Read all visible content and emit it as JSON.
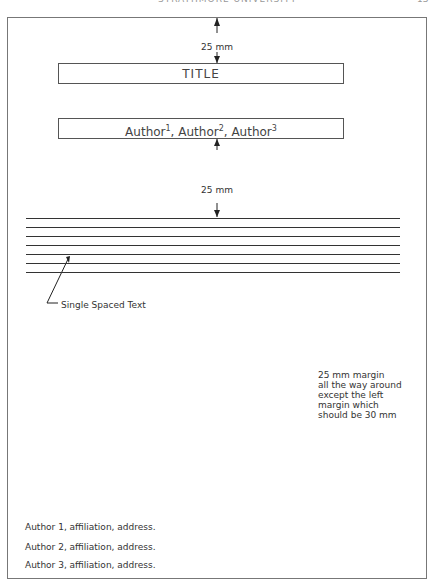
{
  "header": {
    "running_title": "STRATHMORE UNIVERSITY",
    "page_number": "13"
  },
  "template": {
    "top_margin_label": "25 mm",
    "title_box": "TITLE",
    "authors_box": {
      "names": [
        "Author",
        "Author",
        "Author"
      ],
      "superscripts": [
        "1",
        "2",
        "3"
      ],
      "separator": ", "
    },
    "gap_label": "25 mm",
    "text_lines_count": 7,
    "text_caption": "Single Spaced Text",
    "margin_note": [
      "25 mm margin",
      "all the way around",
      "except the left",
      "margin which",
      "should be 30 mm"
    ],
    "affiliations": [
      "Author 1, affiliation, address.",
      "Author 2, affiliation, address.",
      "Author 3, affiliation, address."
    ]
  }
}
